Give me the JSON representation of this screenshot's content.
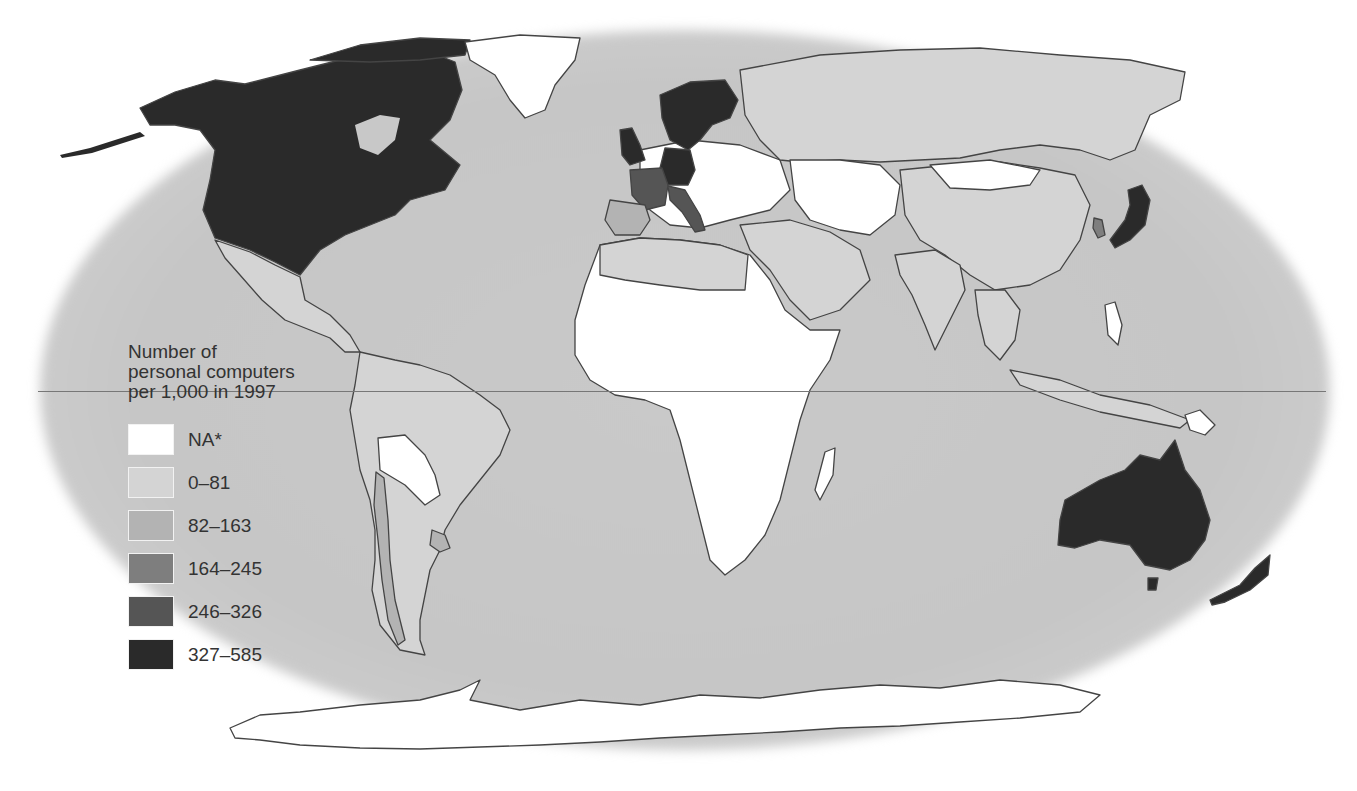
{
  "map": {
    "title": "Number of personal computers per 1,000 in 1997",
    "projection": "world map, elliptical ocean background with equator line"
  },
  "legend": {
    "title": "Number of personal computers per 1,000 in 1997",
    "title_lines": [
      "Number of",
      "personal computers",
      "per 1,000 in 1997"
    ],
    "items": [
      {
        "label": "NA*",
        "color": "#ffffff"
      },
      {
        "label": "0–81",
        "color": "#d4d4d4"
      },
      {
        "label": "82–163",
        "color": "#b3b3b3"
      },
      {
        "label": "164–245",
        "color": "#7e7e7e"
      },
      {
        "label": "246–326",
        "color": "#555555"
      },
      {
        "label": "327–585",
        "color": "#2a2a2a"
      }
    ]
  },
  "colors": {
    "ocean": "#c8c8c8",
    "border": "#444444",
    "equator": "#777777",
    "background": "#ffffff"
  },
  "regions": {
    "north_america": "327–585",
    "mexico": "0–81",
    "australia": "327–585",
    "new_zealand": "327–585",
    "japan": "327–585",
    "scandinavia": "327–585",
    "uk": "327–585",
    "germany": "327–585",
    "france": "246–326",
    "italy": "246–326",
    "spain": "82–163",
    "south_korea": "164–245",
    "russia": "0–81",
    "china": "0–81",
    "africa": "NA*",
    "brazil": "0–81",
    "chile": "82–163",
    "uruguay": "82–163",
    "bolivia": "NA*",
    "paraguay": "NA*",
    "greenland": "NA*",
    "antarctica": "NA*"
  },
  "footnote": {
    "text": ""
  }
}
